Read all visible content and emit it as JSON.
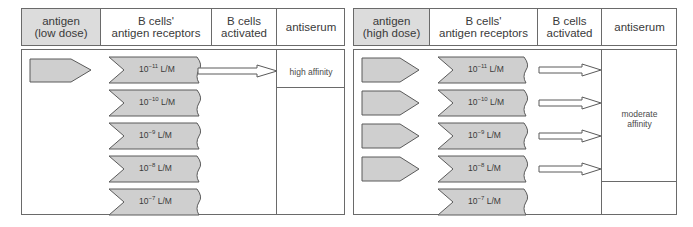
{
  "left_panel": {
    "headers": [
      "antigen\n(low dose)",
      "B cells'\nantigen receptors",
      "B cells\nactivated",
      "antiserum"
    ],
    "antigen_count": 1,
    "receptors": [
      {
        "base": "10",
        "exp": "−11",
        "unit": "L/M",
        "activated": true
      },
      {
        "base": "10",
        "exp": "−10",
        "unit": "L/M",
        "activated": false
      },
      {
        "base": "10",
        "exp": "−9",
        "unit": "L/M",
        "activated": false
      },
      {
        "base": "10",
        "exp": "−8",
        "unit": "L/M",
        "activated": false
      },
      {
        "base": "10",
        "exp": "−7",
        "unit": "L/M",
        "activated": false
      }
    ],
    "antiserum": "high affinity"
  },
  "right_panel": {
    "headers": [
      "antigen\n(high dose)",
      "B cells'\nantigen receptors",
      "B cells\nactivated",
      "antiserum"
    ],
    "antigen_count": 4,
    "receptors": [
      {
        "base": "10",
        "exp": "−11",
        "unit": "L/M",
        "activated": true
      },
      {
        "base": "10",
        "exp": "−10",
        "unit": "L/M",
        "activated": true
      },
      {
        "base": "10",
        "exp": "−9",
        "unit": "L/M",
        "activated": true
      },
      {
        "base": "10",
        "exp": "−8",
        "unit": "L/M",
        "activated": true
      },
      {
        "base": "10",
        "exp": "−7",
        "unit": "L/M",
        "activated": false
      }
    ],
    "antiserum": "moderate\naffinity"
  },
  "colors": {
    "shape_fill": "#cfcfcf",
    "header_shaded": "#dcdcdc",
    "line": "#6a6a6a"
  }
}
